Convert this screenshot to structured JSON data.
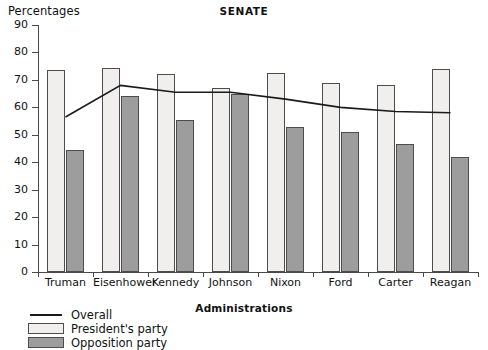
{
  "chart_data": {
    "type": "bar",
    "title": "SENATE",
    "xlabel": "Administrations",
    "ylabel": "Percentages",
    "ylim": [
      0,
      90
    ],
    "yticks": [
      0,
      10,
      20,
      30,
      40,
      50,
      60,
      70,
      80,
      90
    ],
    "grid": false,
    "legend_position": "below-left",
    "categories": [
      "Truman",
      "Eisenhower",
      "Kennedy",
      "Johnson",
      "Nixon",
      "Ford",
      "Carter",
      "Reagan"
    ],
    "series": [
      {
        "name": "President's party",
        "type": "bar",
        "color": "#f0efee",
        "values": [
          73.5,
          74.5,
          72,
          67,
          72.5,
          69,
          68,
          74
        ]
      },
      {
        "name": "Opposition party",
        "type": "bar",
        "color": "#9d9d9d",
        "values": [
          44.5,
          64,
          55.5,
          65,
          53,
          51,
          46.5,
          42
        ]
      },
      {
        "name": "Overall",
        "type": "line",
        "color": "#1a1a1a",
        "values": [
          56.5,
          68,
          65.5,
          65.5,
          63,
          60,
          58.5,
          58
        ]
      }
    ]
  },
  "legend": {
    "items": [
      {
        "label": "Overall",
        "marker": "line"
      },
      {
        "label": "President's party",
        "marker": "light-swatch"
      },
      {
        "label": "Opposition party",
        "marker": "dark-swatch"
      }
    ]
  }
}
